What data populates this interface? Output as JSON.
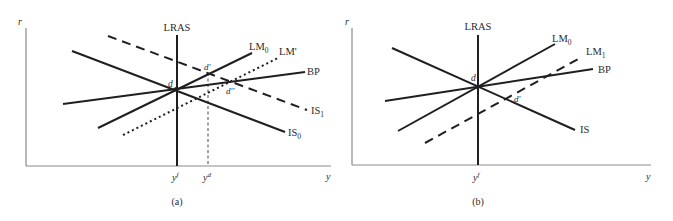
{
  "panels": [
    {
      "id": "a",
      "caption": "(a)",
      "axes": {
        "y_label": "r",
        "x_label": "y"
      },
      "curves": {
        "lras": "LRAS",
        "is0": {
          "base": "IS",
          "sub": "0"
        },
        "is1": {
          "base": "IS",
          "sub": "1"
        },
        "lm0": {
          "base": "LM",
          "sub": "0"
        },
        "lm_prime": "LM'",
        "bp": "BP"
      },
      "points": {
        "d": "d",
        "d_prime": "d'",
        "d_double_prime": "d''"
      },
      "x_ticks": {
        "yf": {
          "base": "y",
          "sup": "f"
        },
        "yd": {
          "base": "y",
          "sup": "d"
        }
      }
    },
    {
      "id": "b",
      "caption": "(b)",
      "axes": {
        "y_label": "r",
        "x_label": "y"
      },
      "curves": {
        "lras": "LRAS",
        "is": "IS",
        "lm0": {
          "base": "LM",
          "sub": "0"
        },
        "lm1": {
          "base": "LM",
          "sub": "1"
        },
        "bp": "BP"
      },
      "points": {
        "d": "d",
        "d_prime": "d'"
      },
      "x_ticks": {
        "yf": {
          "base": "y",
          "sup": "f"
        }
      }
    }
  ],
  "colors": {
    "line": "#1f1f1f",
    "axis": "#8a8a8a",
    "text": "#2b2b2b",
    "background": "#ffffff"
  }
}
